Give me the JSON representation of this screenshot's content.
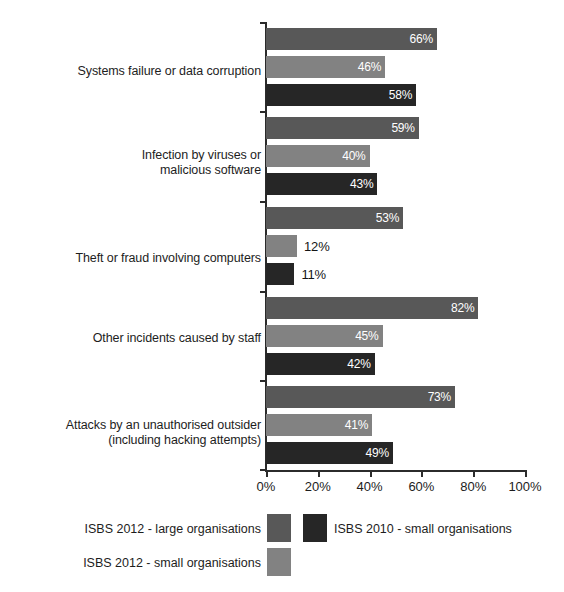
{
  "chart_data": {
    "type": "bar",
    "orientation": "horizontal",
    "title": "",
    "subtitle": "",
    "xlabel": "",
    "ylabel": "",
    "xlim": [
      0,
      100
    ],
    "grid": false,
    "legend_position": "bottom",
    "xticks": [
      "0%",
      "20%",
      "40%",
      "60%",
      "80%",
      "100%"
    ],
    "xtick_values": [
      0,
      20,
      40,
      60,
      80,
      100
    ],
    "categories": [
      "Systems failure or data corruption",
      "Infection by viruses or\nmalicious software",
      "Theft or fraud involving computers",
      "Other incidents caused by staff",
      "Attacks by an unauthorised outsider\n(including hacking attempts)"
    ],
    "series": [
      {
        "name": "ISBS 2012 - large organisations",
        "color": "#585858",
        "values": [
          66,
          59,
          53,
          82,
          73
        ],
        "labels": [
          "66%",
          "59%",
          "53%",
          "82%",
          "73%"
        ]
      },
      {
        "name": "ISBS 2012 - small organisations",
        "color": "#828282",
        "values": [
          46,
          40,
          12,
          45,
          41
        ],
        "labels": [
          "46%",
          "40%",
          "12%",
          "45%",
          "41%"
        ]
      },
      {
        "name": "ISBS 2010 - small organisations",
        "color": "#262626",
        "values": [
          58,
          43,
          11,
          42,
          49
        ],
        "labels": [
          "58%",
          "43%",
          "11%",
          "42%",
          "49%"
        ]
      }
    ]
  },
  "legend": {
    "entries": [
      {
        "label": "ISBS 2012 - large organisations",
        "color": "#585858"
      },
      {
        "label": "ISBS 2010 - small organisations",
        "color": "#262626"
      },
      {
        "label": "ISBS 2012 - small organisations",
        "color": "#828282"
      }
    ]
  }
}
